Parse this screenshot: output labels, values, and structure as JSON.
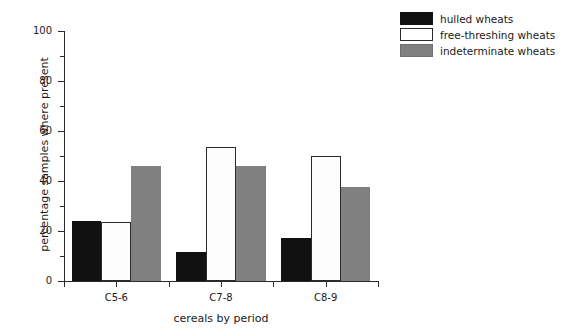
{
  "chart_data": {
    "type": "bar",
    "title": "",
    "xlabel": "cereals by period",
    "ylabel": "percentage samples where present",
    "categories": [
      "C5-6",
      "C7-8",
      "C8-9"
    ],
    "series": [
      {
        "name": "hulled wheats",
        "color": "#111111",
        "values": [
          24,
          11.6,
          17.2
        ]
      },
      {
        "name": "free-threshing wheats",
        "color": "#ffffff",
        "values": [
          23.5,
          53.5,
          50
        ]
      },
      {
        "name": "indeterminate wheats",
        "color": "#808080",
        "values": [
          46,
          46,
          37.5
        ]
      }
    ],
    "ylim": [
      0,
      100
    ],
    "ytick_labels": [
      "0",
      "20",
      "40",
      "60",
      "80",
      "100"
    ],
    "ytick_values": [
      0,
      20,
      40,
      60,
      80,
      100
    ],
    "yminor_values": [
      10,
      30,
      50,
      70,
      90
    ],
    "grid": false,
    "legend_position": "top-right"
  }
}
